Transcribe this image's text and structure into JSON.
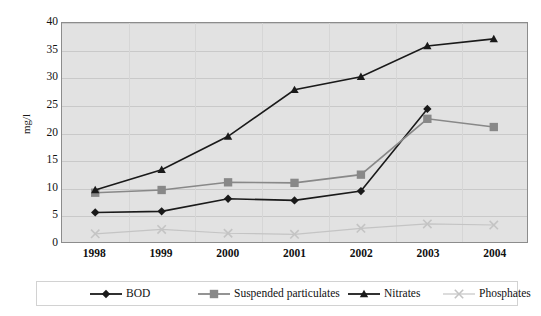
{
  "chart_data": {
    "type": "line",
    "title": "",
    "xlabel": "",
    "ylabel": "mg/l",
    "categories": [
      "1998",
      "1999",
      "2000",
      "2001",
      "2002",
      "2003",
      "2004"
    ],
    "ylim": [
      0,
      40
    ],
    "ytick_labels": [
      "0",
      "5",
      "10",
      "15",
      "20",
      "25",
      "30",
      "35",
      "40"
    ],
    "yticks": [
      0,
      5,
      10,
      15,
      20,
      25,
      30,
      35,
      40
    ],
    "grid": true,
    "legend_position": "bottom",
    "series": [
      {
        "name": "BOD",
        "marker": "diamond",
        "color": "#1a1a1a",
        "values": [
          5.4,
          5.6,
          7.9,
          7.6,
          9.3,
          24.3,
          null
        ]
      },
      {
        "name": "Suspended particulates",
        "marker": "square",
        "color": "#888888",
        "values": [
          9.0,
          9.5,
          10.9,
          10.8,
          12.3,
          22.5,
          21.0
        ]
      },
      {
        "name": "Nitrates",
        "marker": "triangle",
        "color": "#1a1a1a",
        "values": [
          9.5,
          13.2,
          19.3,
          27.8,
          30.2,
          35.8,
          37.1
        ]
      },
      {
        "name": "Phosphates",
        "marker": "x",
        "color": "#c4c4c4",
        "values": [
          1.5,
          2.3,
          1.6,
          1.4,
          2.5,
          3.3,
          3.1
        ]
      }
    ]
  },
  "legend": {
    "items": [
      {
        "label": "BOD"
      },
      {
        "label": "Suspended particulates"
      },
      {
        "label": "Nitrates"
      },
      {
        "label": "Phosphates"
      }
    ]
  },
  "axes": {
    "y_title": "mg/l"
  }
}
